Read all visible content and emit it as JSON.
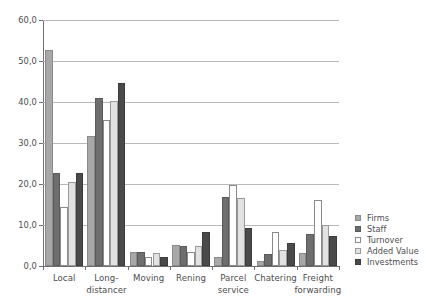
{
  "chart_data": {
    "type": "bar",
    "title": "",
    "subtitle": "",
    "xlabel": "",
    "ylabel": "",
    "ylim": [
      0,
      60
    ],
    "ytick_labels": [
      "0,0",
      "10,0",
      "20,0",
      "30,0",
      "40,0",
      "50,0",
      "60,0"
    ],
    "ytick_values": [
      0,
      10,
      20,
      30,
      40,
      50,
      60
    ],
    "grid": true,
    "legend_position": "right",
    "categories": [
      "Local",
      "Long-\ndistancer",
      "Moving",
      "Rening",
      "Parcel\nservice",
      "Chatering",
      "Freight\nforwarding"
    ],
    "series": [
      {
        "name": "Firms",
        "color": "#a8a8a8",
        "border": "#8a8a8a",
        "values": [
          52.7,
          31.8,
          3.3,
          5.1,
          2.3,
          1.2,
          3.2
        ]
      },
      {
        "name": "Staff",
        "color": "#6e6e6e",
        "border": "#5a5a5a",
        "values": [
          22.7,
          41.1,
          3.3,
          5.0,
          16.9,
          2.9,
          7.9
        ]
      },
      {
        "name": "Turnover",
        "color": "#ffffff",
        "border": "#8a8a8a",
        "values": [
          14.3,
          35.5,
          2.2,
          3.4,
          19.8,
          8.3,
          16.1
        ]
      },
      {
        "name": "Added Value",
        "color": "#e2e2e2",
        "border": "#9a9a9a",
        "values": [
          20.4,
          40.3,
          3.2,
          4.9,
          16.7,
          3.8,
          10.0
        ]
      },
      {
        "name": "Investments",
        "color": "#4a4a4a",
        "border": "#3c3c3c",
        "values": [
          22.6,
          44.7,
          2.2,
          8.2,
          9.3,
          5.5,
          7.2
        ]
      }
    ]
  }
}
